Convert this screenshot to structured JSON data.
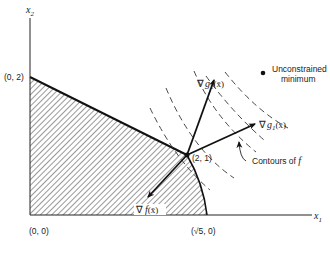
{
  "diagram": {
    "type": "constrained-optimization-geometry",
    "axes": {
      "x_label": "x",
      "x_sub": "1",
      "y_label": "x",
      "y_sub": "2"
    },
    "points": {
      "origin": "(0, 0)",
      "y_intercept": "(0, 2)",
      "optimum": "(2, 1)",
      "x_intercept_prefix": "(√5, 0)"
    },
    "gradients": {
      "g2": {
        "nabla": "∇",
        "name": "g",
        "sub": "2",
        "arg": "(x̄)"
      },
      "g1": {
        "nabla": "∇",
        "name": "g",
        "sub": "1",
        "arg": "(x̄)"
      },
      "f": {
        "nabla": "∇",
        "name": "f",
        "arg": "(x̄)"
      }
    },
    "annotations": {
      "unconstrained_line1": "Unconstrained",
      "unconstrained_line2": "minimum",
      "contours_text": "Contours of ",
      "contours_f": "f"
    },
    "feasible_region": "hatched region bounded by axes, line from (0,2) to (2,1), and circle arc from (2,1) to (√5,0)"
  }
}
